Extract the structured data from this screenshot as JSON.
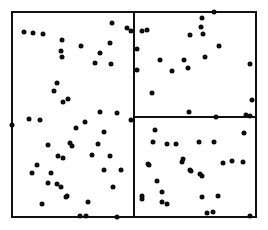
{
  "figure": {
    "title": "",
    "background_color": "#ffffff",
    "frame_color": "#111111",
    "point_color": "#0d0d0d",
    "width": 268,
    "height": 230
  },
  "frame": {
    "x": 11,
    "y": 11,
    "width": 246,
    "height": 207,
    "border_width": 2
  },
  "partitions": {
    "vertical_split": {
      "x": 133,
      "y_top": 11,
      "y_bottom": 218,
      "thickness": 2
    },
    "horizontal_split": {
      "y": 116,
      "x_left": 133,
      "x_right": 257,
      "thickness": 2
    },
    "regions": [
      {
        "name": "left-region",
        "x": 13,
        "y": 13,
        "width": 120,
        "height": 203
      },
      {
        "name": "top-right-region",
        "x": 135,
        "y": 13,
        "width": 120,
        "height": 103
      },
      {
        "name": "bottom-right-region",
        "x": 135,
        "y": 118,
        "width": 120,
        "height": 98
      }
    ]
  },
  "chart_data": {
    "type": "scatter",
    "title": "",
    "xlabel": "",
    "ylabel": "",
    "xlim": [
      0,
      268
    ],
    "ylim": [
      0,
      230
    ],
    "grid": false,
    "legend_position": "none",
    "marker": {
      "shape": "circle",
      "size_px": 5,
      "color": "#0d0d0d"
    },
    "annotations": [
      "Three axis-aligned rectangular partitions separate the point set",
      "Vertical split line at x = 133",
      "Horizontal split line at y = 116 spanning the right half"
    ],
    "series": [
      {
        "name": "left-region-points",
        "count": 46,
        "points": [
          [
            24,
            32
          ],
          [
            33,
            33
          ],
          [
            43,
            34
          ],
          [
            62,
            40
          ],
          [
            61,
            51
          ],
          [
            112,
            23
          ],
          [
            127,
            28
          ],
          [
            131,
            31
          ],
          [
            110,
            43
          ],
          [
            81,
            46
          ],
          [
            100,
            53
          ],
          [
            95,
            63
          ],
          [
            111,
            64
          ],
          [
            62,
            57
          ],
          [
            57,
            83
          ],
          [
            54,
            91
          ],
          [
            68,
            99
          ],
          [
            63,
            102
          ],
          [
            100,
            112
          ],
          [
            117,
            113
          ],
          [
            131,
            120
          ],
          [
            85,
            122
          ],
          [
            76,
            128
          ],
          [
            104,
            132
          ],
          [
            29,
            119
          ],
          [
            40,
            120
          ],
          [
            12,
            125
          ],
          [
            70,
            143
          ],
          [
            98,
            144
          ],
          [
            48,
            145
          ],
          [
            72,
            146
          ],
          [
            92,
            155
          ],
          [
            110,
            156
          ],
          [
            58,
            156
          ],
          [
            63,
            158
          ],
          [
            37,
            165
          ],
          [
            32,
            173
          ],
          [
            51,
            173
          ],
          [
            48,
            183
          ],
          [
            57,
            184
          ],
          [
            61,
            187
          ],
          [
            67,
            196
          ],
          [
            42,
            204
          ],
          [
            104,
            170
          ],
          [
            121,
            170
          ],
          [
            113,
            187
          ],
          [
            66,
            197
          ],
          [
            88,
            202
          ],
          [
            80,
            216
          ],
          [
            86,
            216
          ],
          [
            117,
            217
          ]
        ]
      },
      {
        "name": "top-right-region-points",
        "count": 21,
        "points": [
          [
            142,
            31
          ],
          [
            147,
            30
          ],
          [
            137,
            49
          ],
          [
            137,
            70
          ],
          [
            214,
            12
          ],
          [
            202,
            18
          ],
          [
            201,
            27
          ],
          [
            190,
            35
          ],
          [
            203,
            34
          ],
          [
            219,
            46
          ],
          [
            160,
            60
          ],
          [
            184,
            60
          ],
          [
            172,
            71
          ],
          [
            205,
            57
          ],
          [
            188,
            68
          ],
          [
            152,
            93
          ],
          [
            250,
            64
          ],
          [
            252,
            100
          ],
          [
            189,
            112
          ],
          [
            216,
            117
          ],
          [
            142,
            199
          ]
        ]
      },
      {
        "name": "bottom-right-region-points",
        "count": 28,
        "points": [
          [
            250,
            116
          ],
          [
            155,
            130
          ],
          [
            244,
            133
          ],
          [
            153,
            142
          ],
          [
            167,
            144
          ],
          [
            176,
            144
          ],
          [
            199,
            142
          ],
          [
            214,
            142
          ],
          [
            183,
            159
          ],
          [
            148,
            164
          ],
          [
            149,
            165
          ],
          [
            182,
            162
          ],
          [
            223,
            163
          ],
          [
            232,
            161
          ],
          [
            243,
            162
          ],
          [
            190,
            170
          ],
          [
            191,
            171
          ],
          [
            202,
            176
          ],
          [
            157,
            181
          ],
          [
            162,
            192
          ],
          [
            200,
            174
          ],
          [
            142,
            196
          ],
          [
            162,
            202
          ],
          [
            167,
            204
          ],
          [
            202,
            197
          ],
          [
            218,
            196
          ],
          [
            207,
            213
          ],
          [
            213,
            212
          ],
          [
            250,
            216
          ],
          [
            246,
            115
          ]
        ]
      }
    ]
  }
}
